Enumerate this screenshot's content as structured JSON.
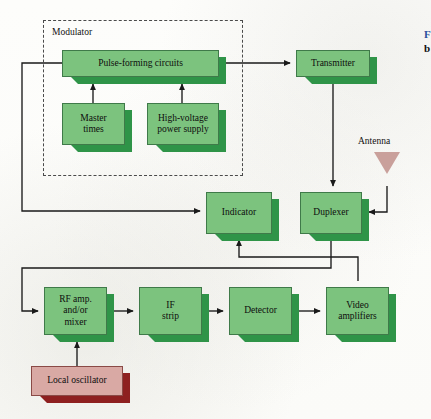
{
  "figure": {
    "type": "block-diagram",
    "caption_fragment_blue": "F",
    "caption_fragment_bold": "b"
  },
  "groups": [
    {
      "id": "modulator",
      "label": "Modulator",
      "x": 43,
      "y": 20,
      "w": 200,
      "h": 156
    }
  ],
  "blocks": [
    {
      "id": "pulse-forming-circuits",
      "label": "Pulse-forming circuits",
      "color": "green",
      "x": 62,
      "y": 50,
      "w": 157,
      "h": 27
    },
    {
      "id": "master-times",
      "label": "Master\ntimes",
      "color": "green",
      "x": 62,
      "y": 103,
      "w": 63,
      "h": 42
    },
    {
      "id": "high-voltage-power-supply",
      "label": "High-voltage\npower supply",
      "color": "green",
      "x": 147,
      "y": 103,
      "w": 72,
      "h": 42
    },
    {
      "id": "transmitter",
      "label": "Transmitter",
      "color": "green",
      "x": 296,
      "y": 50,
      "w": 74,
      "h": 27
    },
    {
      "id": "indicator",
      "label": "Indicator",
      "color": "green",
      "x": 206,
      "y": 192,
      "w": 66,
      "h": 42
    },
    {
      "id": "duplexer",
      "label": "Duplexer",
      "color": "green",
      "x": 300,
      "y": 192,
      "w": 62,
      "h": 42
    },
    {
      "id": "rf-amp-mixer",
      "label": "RF amp.\nand/or\nmixer",
      "color": "green",
      "x": 44,
      "y": 287,
      "w": 63,
      "h": 48
    },
    {
      "id": "if-strip",
      "label": "IF\nstrip",
      "color": "green",
      "x": 139,
      "y": 287,
      "w": 63,
      "h": 48
    },
    {
      "id": "detector",
      "label": "Detector",
      "color": "green",
      "x": 229,
      "y": 287,
      "w": 63,
      "h": 48
    },
    {
      "id": "video-amplifiers",
      "label": "Video\namplifiers",
      "color": "green",
      "x": 326,
      "y": 287,
      "w": 63,
      "h": 48
    },
    {
      "id": "local-oscillator",
      "label": "Local oscillator",
      "color": "red",
      "x": 31,
      "y": 366,
      "w": 92,
      "h": 30
    }
  ],
  "antenna": {
    "id": "antenna",
    "label": "Antenna",
    "x": 374,
    "y": 152,
    "label_x": 358,
    "label_y": 136
  },
  "colors": {
    "box_face_green": "#7cc37e",
    "box_shadow_green": "#2f9448",
    "box_border_green": "#3f7a49",
    "box_face_red": "#d9a9a4",
    "box_shadow_red": "#8e2020",
    "antenna_fill": "#c9a09b",
    "wire": "#1a1a1a",
    "dash_border": "#4a4a4a",
    "caption_blue": "#2b4f9e",
    "paper": "#fdfdfb"
  },
  "connections": [
    {
      "from": "master-times",
      "to": "pulse-forming-circuits",
      "arrow": "up"
    },
    {
      "from": "high-voltage-power-supply",
      "to": "pulse-forming-circuits",
      "arrow": "up"
    },
    {
      "from": "pulse-forming-circuits",
      "to": "transmitter",
      "arrow": "right"
    },
    {
      "from": "transmitter",
      "to": "duplexer",
      "arrow": "down"
    },
    {
      "from": "antenna",
      "to": "duplexer",
      "arrow": "left"
    },
    {
      "from": "duplexer",
      "to": "rf-amp-mixer",
      "arrow": "right"
    },
    {
      "from": "local-oscillator",
      "to": "rf-amp-mixer",
      "arrow": "up"
    },
    {
      "from": "rf-amp-mixer",
      "to": "if-strip",
      "arrow": "right"
    },
    {
      "from": "if-strip",
      "to": "detector",
      "arrow": "right"
    },
    {
      "from": "detector",
      "to": "video-amplifiers",
      "arrow": "right"
    },
    {
      "from": "video-amplifiers",
      "to": "indicator",
      "arrow": "up"
    },
    {
      "from": "pulse-forming-circuits",
      "to": "indicator",
      "arrow": "right"
    }
  ]
}
